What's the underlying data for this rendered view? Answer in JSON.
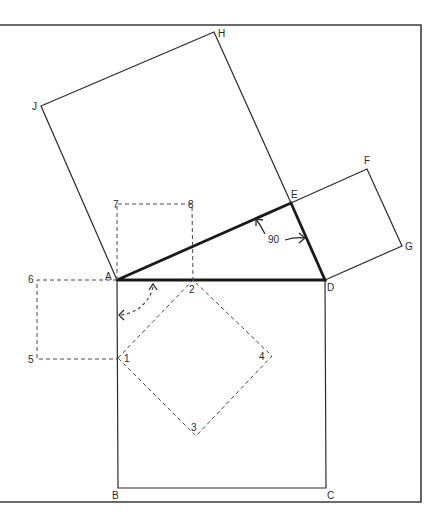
{
  "diagram": {
    "title": "",
    "colors": {
      "background": "#ffffff",
      "line": "#2b2b2b",
      "frame": "#3a3a3a",
      "dashed": "#4a4a4a"
    },
    "points": {
      "A": {
        "label": "A",
        "x": 117,
        "y": 280
      },
      "B": {
        "label": "B",
        "x": 118,
        "y": 488
      },
      "C": {
        "label": "C",
        "x": 326,
        "y": 488
      },
      "D": {
        "label": "D",
        "x": 325,
        "y": 280
      },
      "E": {
        "label": "E",
        "x": 291,
        "y": 203
      },
      "F": {
        "label": "F",
        "x": 367,
        "y": 169
      },
      "G": {
        "label": "G",
        "x": 402,
        "y": 246
      },
      "H": {
        "label": "H",
        "x": 214,
        "y": 32
      },
      "J": {
        "label": "J",
        "x": 41,
        "y": 106
      },
      "p1": {
        "label": "1",
        "x": 118,
        "y": 358
      },
      "p2": {
        "label": "2",
        "x": 193,
        "y": 280
      },
      "p3": {
        "label": "3",
        "x": 196,
        "y": 436
      },
      "p4": {
        "label": "4",
        "x": 272,
        "y": 356
      },
      "p5": {
        "label": "5",
        "x": 37,
        "y": 359
      },
      "p6": {
        "label": "6",
        "x": 37,
        "y": 280
      },
      "p7": {
        "label": "7",
        "x": 117,
        "y": 204
      },
      "p8": {
        "label": "8",
        "x": 192,
        "y": 204
      }
    },
    "shapes": {
      "square_on_AD": "ABCD",
      "square_on_AE": "AEHJ",
      "square_on_ED": "EFGD",
      "dashed_square_left": "A-6-5-1",
      "dashed_square_top": "A-7-8-2",
      "dashed_diamond": "1-2-4-3",
      "triangle": "ADE (thick)"
    },
    "annotations": {
      "right_angle_label": "90"
    }
  }
}
